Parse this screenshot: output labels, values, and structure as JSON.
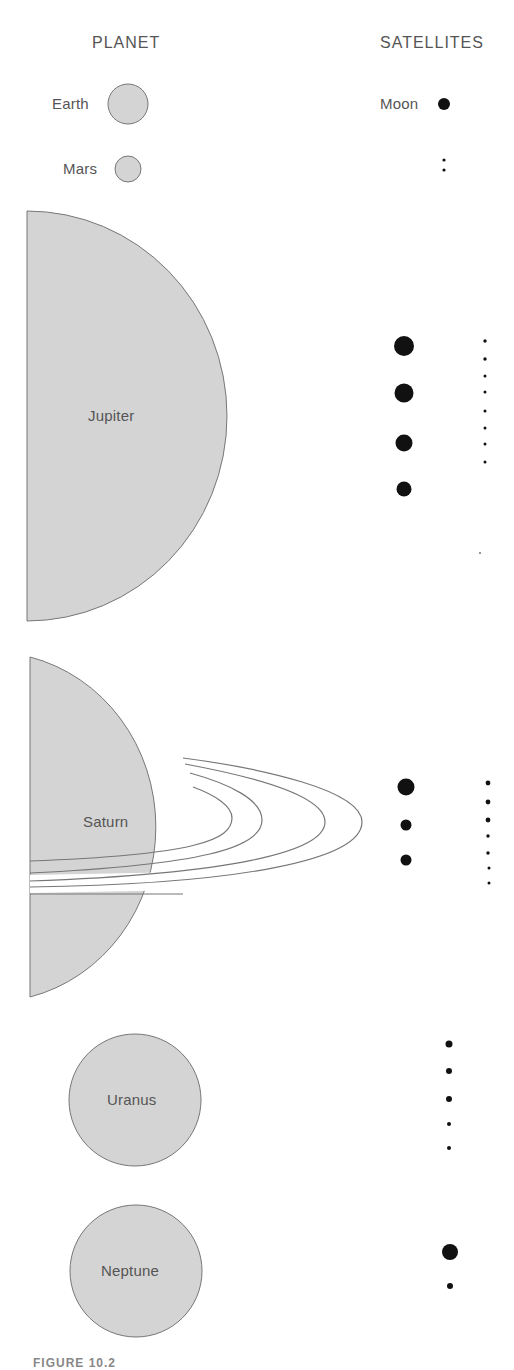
{
  "headers": {
    "planet": "PLANET",
    "satellites": "SATELLITES"
  },
  "colors": {
    "planet_fill": "#d4d4d4",
    "planet_stroke": "#777777",
    "satellite_fill": "#111111",
    "text": "#555555",
    "background": "#ffffff"
  },
  "planets": [
    {
      "name": "Earth",
      "label": "Earth",
      "satellite_label": "Moon",
      "large_satellites": 1,
      "small_satellites": 0
    },
    {
      "name": "Mars",
      "label": "Mars",
      "large_satellites": 0,
      "small_satellites": 2
    },
    {
      "name": "Jupiter",
      "label": "Jupiter",
      "large_satellites": 4,
      "small_satellites": 9
    },
    {
      "name": "Saturn",
      "label": "Saturn",
      "large_satellites": 3,
      "small_satellites": 7
    },
    {
      "name": "Uranus",
      "label": "Uranus",
      "large_satellites": 0,
      "small_satellites": 5
    },
    {
      "name": "Neptune",
      "label": "Neptune",
      "large_satellites": 1,
      "small_satellites": 1
    }
  ],
  "caption": "FIGURE 10.2"
}
